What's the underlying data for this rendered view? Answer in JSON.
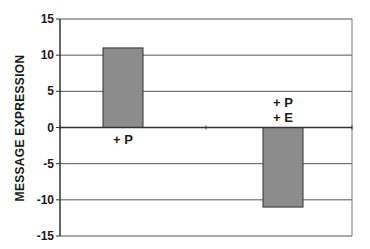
{
  "chart_data": {
    "type": "bar",
    "title": "",
    "xlabel": "",
    "ylabel": "MESSAGE EXPRESSION",
    "ylim": [
      -15,
      15
    ],
    "yticks": [
      15,
      10,
      5,
      0,
      -5,
      -10,
      -15
    ],
    "grid": true,
    "legend": null,
    "categories": [
      "+ P",
      "+ P\n+ E"
    ],
    "category_lines": [
      [
        "+ P"
      ],
      [
        "+ P",
        "+ E"
      ]
    ],
    "values": [
      11,
      -11
    ],
    "colors": {
      "bar": "#8c8c8c",
      "bar_border": "#333333",
      "grid": "#555555",
      "axis": "#333333"
    }
  }
}
